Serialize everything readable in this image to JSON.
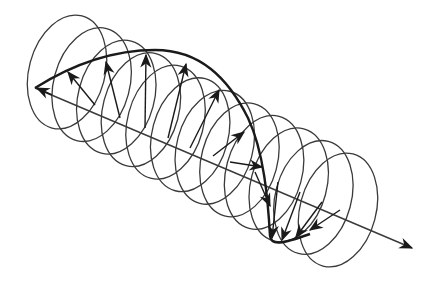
{
  "diagram": {
    "title": "Helical field rotation along propagation axis",
    "colors": {
      "stroke": "#3a3a3a",
      "thick": "#1a1a1a",
      "background": "#ffffff"
    },
    "axis": {
      "start": [
        35,
        88
      ],
      "end": [
        412,
        248
      ]
    },
    "loops": {
      "count": 12,
      "first_center": [
        67,
        72
      ],
      "last_center": [
        338,
        210
      ],
      "rx": 38,
      "ry": 58,
      "rotation_deg": 15
    },
    "envelope_path": "M35,88 C70,66 110,50 155,50 C200,50 228,78 248,118 C264,152 268,200 270,236 C271,246 282,244 310,234",
    "vectors": [
      {
        "from": [
          52,
          95
        ],
        "to": [
          37,
          88
        ]
      },
      {
        "from": [
          95,
          105
        ],
        "to": [
          68,
          72
        ]
      },
      {
        "from": [
          120,
          118
        ],
        "to": [
          106,
          62
        ]
      },
      {
        "from": [
          145,
          128
        ],
        "to": [
          146,
          55
        ]
      },
      {
        "from": [
          168,
          138
        ],
        "to": [
          186,
          64
        ]
      },
      {
        "from": [
          190,
          148
        ],
        "to": [
          219,
          90
        ]
      },
      {
        "from": [
          213,
          156
        ],
        "to": [
          244,
          132
        ]
      },
      {
        "from": [
          230,
          162
        ],
        "to": [
          262,
          167
        ]
      },
      {
        "from": [
          255,
          172
        ],
        "to": [
          270,
          206
        ]
      },
      {
        "from": [
          278,
          182
        ],
        "to": [
          272,
          238
        ]
      },
      {
        "from": [
          300,
          192
        ],
        "to": [
          282,
          240
        ]
      },
      {
        "from": [
          322,
          202
        ],
        "to": [
          296,
          237
        ]
      },
      {
        "from": [
          340,
          210
        ],
        "to": [
          310,
          230
        ]
      }
    ]
  }
}
